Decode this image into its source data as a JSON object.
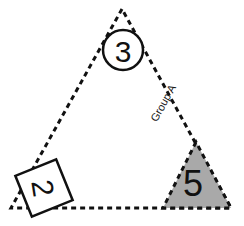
{
  "canvas": {
    "width": 244,
    "height": 226,
    "background": "#ffffff"
  },
  "diagram": {
    "title_label": "Group A",
    "stroke_color": "#111111",
    "shaded_fill": "#a9a9a9",
    "dash_pattern": "5 4",
    "stroke_width": 3,
    "main_triangle": {
      "apex": {
        "x": 122,
        "y": 9
      },
      "bottom_left": {
        "x": 11,
        "y": 208
      },
      "bottom_right": {
        "x": 231,
        "y": 208
      },
      "points": "122,9 11,208 231,208",
      "fill": "none"
    },
    "shaded_triangle": {
      "apex": {
        "x": 196,
        "y": 142
      },
      "bottom_left": {
        "x": 163,
        "y": 208
      },
      "bottom_right": {
        "x": 231,
        "y": 208
      },
      "points": "196,142 163,208 231,208",
      "value": "5",
      "value_x": 193,
      "value_y": 183,
      "value_font_size": 36
    },
    "apex_circle": {
      "cx": 123,
      "cy": 50,
      "r": 20,
      "value": "3",
      "value_font_size": 30,
      "fill": "#ffffff"
    },
    "corner_square": {
      "value": "2",
      "cx": 44,
      "cy": 188,
      "size": 44,
      "box_rotation_deg": -22,
      "text_rotation_deg": 103,
      "value_font_size": 30,
      "fill": "#ffffff"
    },
    "edge_label": {
      "text": "Group A",
      "x": 163,
      "y": 103,
      "rotation_deg": -61
    }
  }
}
